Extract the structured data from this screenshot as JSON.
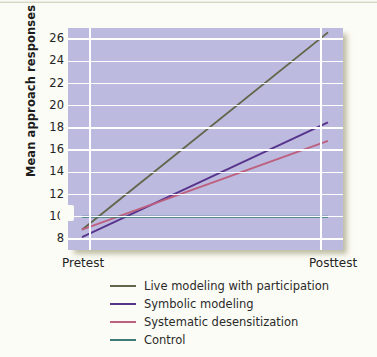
{
  "chart_data": {
    "type": "line",
    "title": "",
    "xlabel": "",
    "ylabel": "Mean approach responses",
    "categories": [
      "Pretest",
      "Posttest"
    ],
    "x_tick_labels": [
      "Pretest",
      "Posttest"
    ],
    "y_tick_labels": [
      "8",
      "10",
      "12",
      "14",
      "16",
      "18",
      "20",
      "22",
      "24",
      "26"
    ],
    "y_ticks": [
      8,
      10,
      12,
      14,
      16,
      18,
      20,
      22,
      24,
      26
    ],
    "ylim": [
      7,
      27
    ],
    "grid": "horizontal-and-vertical",
    "legend_position": "below-plot-left",
    "axis_break": true,
    "plot_background": "#bdbadf",
    "gridline_color": "#ffffff",
    "series": [
      {
        "name": "Live modeling with participation",
        "color": "#63664a",
        "values": [
          9.4,
          26.1
        ]
      },
      {
        "name": "Symbolic modeling",
        "color": "#57348c",
        "values": [
          8.5,
          18.2
        ]
      },
      {
        "name": "Systematic desensitization",
        "color": "#bd5f7e",
        "values": [
          9.1,
          16.6
        ]
      },
      {
        "name": "Control",
        "color": "#3c7a78",
        "values": [
          10.0,
          10.0
        ]
      }
    ]
  },
  "legend": {
    "items": [
      {
        "label": "Live modeling with participation",
        "color": "#63664a"
      },
      {
        "label": "Symbolic modeling",
        "color": "#57348c"
      },
      {
        "label": "Systematic desensitization",
        "color": "#bd5f7e"
      },
      {
        "label": "Control",
        "color": "#3c7a78"
      }
    ]
  }
}
